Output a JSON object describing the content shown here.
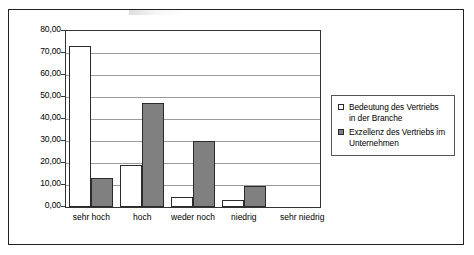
{
  "chart_data": {
    "type": "bar",
    "title": "",
    "subtitle": "",
    "xlabel": "",
    "ylabel": "",
    "categories": [
      "sehr hoch",
      "hoch",
      "weder noch",
      "niedrig",
      "sehr niedrig"
    ],
    "series": [
      {
        "name": "Bedeutung des Vertriebs in der Branche",
        "color": "#ffffff",
        "values": [
          73,
          19,
          4.5,
          3,
          0
        ]
      },
      {
        "name": "Exzellenz des Vertriebs im Unternehmen",
        "color": "#808080",
        "values": [
          13,
          47.5,
          30,
          9.5,
          0
        ]
      }
    ],
    "ylim": [
      0,
      80
    ],
    "ytick_step": 10,
    "ytick_labels": [
      "0,00",
      "10,00",
      "20,00",
      "30,00",
      "40,00",
      "50,00",
      "60,00",
      "70,00",
      "80,00"
    ],
    "grid": "horizontal",
    "legend_position": "right",
    "decimal_separator": ","
  },
  "legend": {
    "entries": [
      {
        "line1": "Bedeutung des Vertriebs",
        "line2": "in der Branche",
        "swatch": "white-square-marker"
      },
      {
        "line1": "Exzellenz des Vertriebs im",
        "line2": "Unternehmen",
        "swatch": "grey-square-marker"
      }
    ]
  },
  "colors": {
    "series_1_fill": "#ffffff",
    "series_2_fill": "#808080",
    "bar_outline": "#2b2b2b",
    "gridline": "#9b9b9b",
    "frame": "#222222",
    "text": "#000000"
  }
}
